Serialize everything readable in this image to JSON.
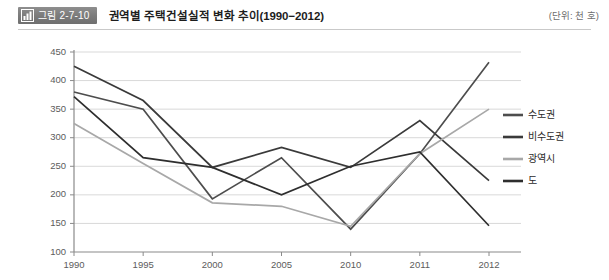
{
  "header": {
    "badge_icon": "bar-chart-icon",
    "badge_label": "그림 2-7-10",
    "title": "권역별 주택건설실적 변화 추이(1990−2012)",
    "unit": "(단위: 천 호)"
  },
  "chart_data": {
    "type": "line",
    "title": "권역별 주택건설실적 변화 추이(1990−2012)",
    "xlabel": "",
    "ylabel": "",
    "unit": "천 호",
    "categories": [
      "1990",
      "1995",
      "2000",
      "2005",
      "2010",
      "2011",
      "2012"
    ],
    "ylim": [
      100,
      450
    ],
    "ytick_step": 50,
    "yticks": [
      100,
      150,
      200,
      250,
      300,
      350,
      400,
      450
    ],
    "grid": true,
    "legend_position": "right",
    "series": [
      {
        "name": "수도권",
        "color": "#4d4d4d",
        "values": [
          380,
          350,
          193,
          265,
          140,
          272,
          432
        ]
      },
      {
        "name": "비수도권",
        "color": "#3a3a3a",
        "values": [
          425,
          365,
          248,
          283,
          248,
          330,
          225
        ]
      },
      {
        "name": "광역시",
        "color": "#a8a8a8",
        "values": [
          325,
          255,
          186,
          180,
          145,
          272,
          350
        ]
      },
      {
        "name": "도",
        "color": "#2e2e2e",
        "values": [
          372,
          265,
          248,
          200,
          250,
          275,
          146
        ]
      }
    ]
  }
}
